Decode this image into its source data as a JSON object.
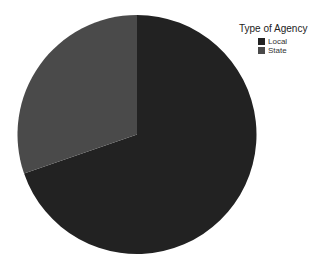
{
  "chart_data": {
    "type": "pie",
    "title": "",
    "legend_title": "Type of Agency",
    "legend_position": "top-right",
    "categories": [
      "Local",
      "State"
    ],
    "values": [
      69.7,
      30.3
    ],
    "colors": [
      "#222222",
      "#4a4a4a"
    ],
    "start_angle_deg": 0,
    "direction": "Local clockwise from 12 o'clock; State counterclockwise from 12 o'clock"
  },
  "legend": {
    "title": "Type of Agency",
    "items": [
      {
        "label": "Local",
        "color": "#222222"
      },
      {
        "label": "State",
        "color": "#4a4a4a"
      }
    ]
  }
}
